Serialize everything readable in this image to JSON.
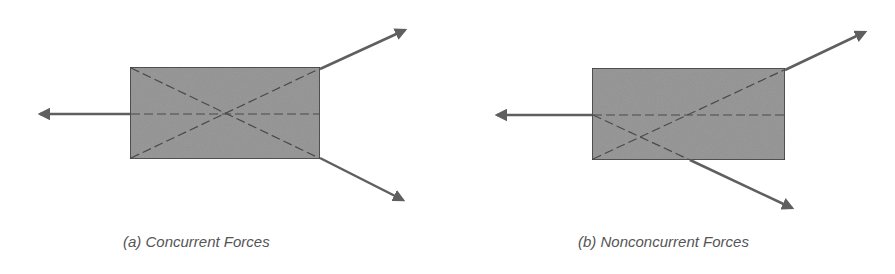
{
  "panels": [
    {
      "id": "a",
      "caption": "(a) Concurrent Forces",
      "body": {
        "x": 130,
        "y": 67,
        "w": 190,
        "h": 92
      },
      "forces": [
        {
          "name": "left-force",
          "x1": 130,
          "y1": 114,
          "x2": 37,
          "y2": 114
        },
        {
          "name": "upper-right-force",
          "x1": 320,
          "y1": 69,
          "x2": 408,
          "y2": 29
        },
        {
          "name": "lower-right-force",
          "x1": 320,
          "y1": 158,
          "x2": 406,
          "y2": 202
        }
      ],
      "lines_of_action": [
        {
          "x1": 131,
          "y1": 114,
          "x2": 319,
          "y2": 114
        },
        {
          "x1": 131,
          "y1": 68,
          "x2": 319,
          "y2": 158
        },
        {
          "x1": 131,
          "y1": 158,
          "x2": 319,
          "y2": 69
        }
      ],
      "concurrency_point": {
        "x": 227,
        "y": 114
      }
    },
    {
      "id": "b",
      "caption": "(b) Nonconcurrent Forces",
      "body": {
        "x": 592,
        "y": 68,
        "w": 193,
        "h": 92
      },
      "forces": [
        {
          "name": "left-force",
          "x1": 592,
          "y1": 115,
          "x2": 494,
          "y2": 115
        },
        {
          "name": "upper-right-force",
          "x1": 785,
          "y1": 70,
          "x2": 868,
          "y2": 31
        },
        {
          "name": "lower-right-force",
          "x1": 690,
          "y1": 160,
          "x2": 795,
          "y2": 210
        }
      ],
      "lines_of_action": [
        {
          "x1": 593,
          "y1": 115,
          "x2": 784,
          "y2": 115
        },
        {
          "x1": 593,
          "y1": 159,
          "x2": 784,
          "y2": 70
        },
        {
          "x1": 593,
          "y1": 115,
          "x2": 690,
          "y2": 160
        }
      ]
    }
  ],
  "colors": {
    "body_fill": "#9a9a9a",
    "body_stroke": "#3a3a3a",
    "arrow": "#5f5f5f",
    "dash": "#4a4a4a",
    "caption": "#555555"
  }
}
